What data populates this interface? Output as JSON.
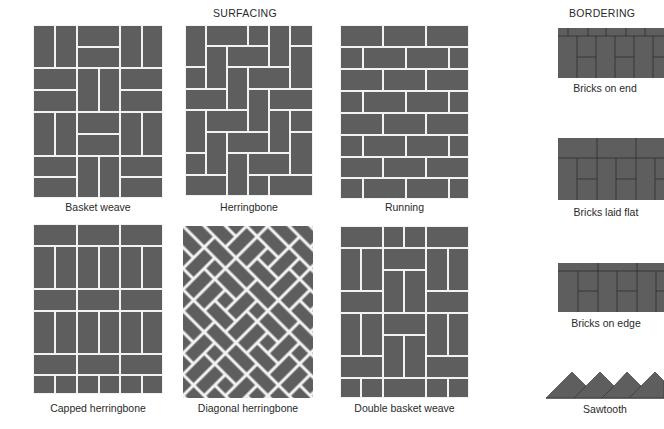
{
  "headings": {
    "surfacing": "SURFACING",
    "bordering": "BORDERING"
  },
  "surfacing": {
    "patterns": [
      {
        "id": "basket-weave",
        "label": "Basket weave"
      },
      {
        "id": "herringbone",
        "label": "Herringbone"
      },
      {
        "id": "running",
        "label": "Running"
      },
      {
        "id": "capped-herringbone",
        "label": "Capped herringbone"
      },
      {
        "id": "diagonal-herringbone",
        "label": "Diagonal herringbone"
      },
      {
        "id": "double-basket-weave",
        "label": "Double basket weave"
      }
    ]
  },
  "bordering": {
    "patterns": [
      {
        "id": "bricks-on-end",
        "label": "Bricks on end"
      },
      {
        "id": "bricks-laid-flat",
        "label": "Bricks laid flat"
      },
      {
        "id": "bricks-on-edge",
        "label": "Bricks on edge"
      },
      {
        "id": "sawtooth",
        "label": "Sawtooth"
      }
    ]
  },
  "colors": {
    "brick": "#5e5e5e",
    "mortar": "#f2f2f2",
    "border_line": "#2e2e2e",
    "background": "#ffffff"
  }
}
